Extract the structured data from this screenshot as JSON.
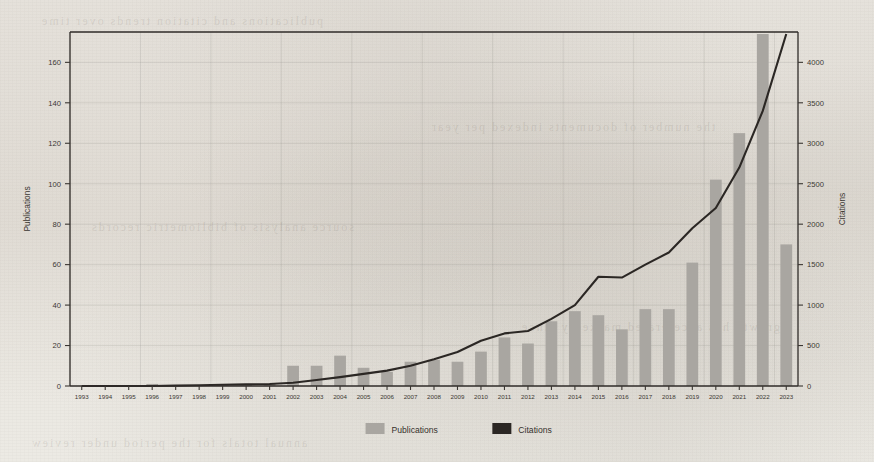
{
  "chart_data": {
    "type": "bar",
    "title": "",
    "subtitle": "",
    "xlabel": "",
    "ylabel": "Publications",
    "y2label": "Citations",
    "ylim": [
      0,
      175
    ],
    "y2lim": [
      0,
      4375
    ],
    "yticks": [
      0,
      20,
      40,
      60,
      80,
      100,
      120,
      140,
      160
    ],
    "y2ticks": [
      0,
      500,
      1000,
      1500,
      2000,
      2500,
      3000,
      3500,
      4000
    ],
    "grid": true,
    "legend_position": "bottom",
    "categories": [
      "1993",
      "1994",
      "1995",
      "1996",
      "1997",
      "1998",
      "1999",
      "2000",
      "2001",
      "2002",
      "2003",
      "2004",
      "2005",
      "2006",
      "2007",
      "2008",
      "2009",
      "2010",
      "2011",
      "2012",
      "2013",
      "2014",
      "2015",
      "2016",
      "2017",
      "2018",
      "2019",
      "2020",
      "2021",
      "2022",
      "2023"
    ],
    "series": [
      {
        "name": "Publications",
        "kind": "bar",
        "axis": "left",
        "color": "#a9a6a1",
        "values": [
          0,
          0,
          0,
          1,
          0,
          0,
          1,
          1,
          1,
          10,
          10,
          15,
          9,
          7,
          12,
          13,
          12,
          17,
          24,
          21,
          32,
          37,
          35,
          28,
          38,
          38,
          61,
          102,
          125,
          174,
          70
        ]
      },
      {
        "name": "Citations",
        "kind": "line",
        "axis": "right",
        "color": "#2b2724",
        "values": [
          0,
          0,
          0,
          0,
          5,
          10,
          15,
          20,
          25,
          40,
          75,
          110,
          150,
          190,
          250,
          330,
          420,
          560,
          650,
          680,
          830,
          1000,
          1350,
          1340,
          1500,
          1650,
          1950,
          2200,
          2700,
          3400,
          4350
        ]
      }
    ]
  },
  "legend": {
    "items": [
      {
        "label": "Publications",
        "swatch": "#a9a6a1",
        "shape": "square-swatch"
      },
      {
        "label": "Citations",
        "swatch": "#2b2724",
        "shape": "square-swatch"
      }
    ]
  },
  "ghost_text": {
    "lines": [
      "publications and citation trends over time",
      "the number of documents indexed per year",
      "source analysis of bibliometric records",
      "growth has accelerated markedly since",
      "annual totals for the period under review"
    ]
  }
}
